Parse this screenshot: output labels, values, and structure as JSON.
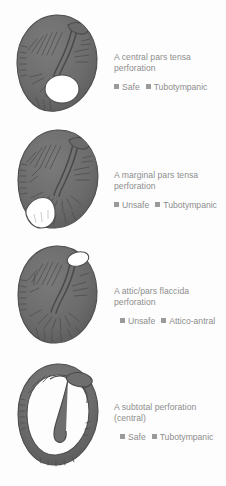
{
  "figure": {
    "background_color": "#fdfdfd",
    "text_color": "#8d8d8d",
    "drum_fill_color": "#6e6e6e",
    "drum_shadow_color": "#545454",
    "perforation_color": "#ffffff",
    "bullet_color": "#9a9a9a"
  },
  "panels": [
    {
      "id": "central-pars-tensa",
      "illustration": "eardrum-central-pars-tensa-perforation",
      "title": "A central pars tensa perforation",
      "title_line_1": "A central pars tensa",
      "title_line_2": "perforation",
      "tags": [
        {
          "bullet": "square-bullet-icon",
          "label": "Safe"
        },
        {
          "bullet": "square-bullet-icon",
          "label": "Tubotympanic"
        }
      ]
    },
    {
      "id": "marginal-pars-tensa",
      "illustration": "eardrum-marginal-pars-tensa-perforation",
      "title": "A marginal pars tensa perforation",
      "title_line_1": "A marginal pars tensa",
      "title_line_2": "perforation",
      "tags": [
        {
          "bullet": "square-bullet-icon",
          "label": "Unsafe"
        },
        {
          "bullet": "square-bullet-icon",
          "label": "Tubotympanic"
        }
      ]
    },
    {
      "id": "attic-pars-flaccida",
      "illustration": "eardrum-attic-pars-flaccida-perforation",
      "title": "A attic/pars flaccida perforation",
      "title_line_1": "A attic/pars flaccida",
      "title_line_2": "perforation",
      "tags": [
        {
          "bullet": "square-bullet-icon",
          "label": "Unsafe"
        },
        {
          "bullet": "square-bullet-icon",
          "label": "Attico-antral"
        }
      ]
    },
    {
      "id": "subtotal-central",
      "illustration": "eardrum-subtotal-central-perforation",
      "title": "A subtotal perforation (central)",
      "title_line_1": "A subtotal perforation",
      "title_line_2": "(central)",
      "tags": [
        {
          "bullet": "square-bullet-icon",
          "label": "Safe"
        },
        {
          "bullet": "square-bullet-icon",
          "label": "Tubotympanic"
        }
      ]
    }
  ]
}
